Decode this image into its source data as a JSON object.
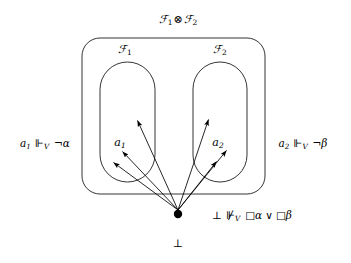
{
  "figure": {
    "type": "logic-frame-diagram",
    "background_color": "#ffffff",
    "stroke_color": "#000000"
  },
  "labels": {
    "tensor_title": "ℱ₁ ⊗ ℱ₂",
    "tensor_title_parts": {
      "left": "ℱ",
      "left_sub": "1",
      "operator": "⊗",
      "right": "ℱ",
      "right_sub": "2"
    },
    "frame_left": "ℱ₁",
    "frame_left_base": "ℱ",
    "frame_left_sub": "1",
    "frame_right": "ℱ₂",
    "frame_right_base": "ℱ",
    "frame_right_sub": "2",
    "node_left": "a₁",
    "node_left_base": "a",
    "node_left_sub": "1",
    "node_right": "a₂",
    "node_right_base": "a",
    "node_right_sub": "2",
    "bottom_node": "⊥"
  },
  "annotations": {
    "left_forcing": {
      "subject": "a",
      "subject_sub": "1",
      "relation": "⊩",
      "relation_sub": "V",
      "formula_neg": "¬",
      "formula_var": "α",
      "full_text": "a₁ ⊩_V ¬α"
    },
    "right_forcing": {
      "subject": "a",
      "subject_sub": "2",
      "relation": "⊩",
      "relation_sub": "V",
      "formula_neg": "¬",
      "formula_var": "β",
      "full_text": "a₂ ⊩_V ¬β"
    },
    "bottom_forcing": {
      "subject": "⊥",
      "relation": "⊮",
      "relation_sub": "V",
      "box_left": "□",
      "var_left": "α",
      "disjunction": "∨",
      "box_right": "□",
      "var_right": "β",
      "full_text": "⊥ ⊮_V □α ∨ □β"
    }
  },
  "shapes": {
    "outer_box": {
      "x": 82,
      "y": 38,
      "width": 183,
      "height": 156,
      "radius": 18
    },
    "capsule_left": {
      "x": 100,
      "y": 62,
      "width": 55,
      "height": 120,
      "radius": 27
    },
    "capsule_right": {
      "x": 193,
      "y": 62,
      "width": 54,
      "height": 120,
      "radius": 27
    },
    "root_dot": {
      "cx": 178,
      "cy": 214,
      "r": 4.2
    }
  },
  "arrows": {
    "count": 6,
    "origin": {
      "x": 178,
      "y": 210
    },
    "targets": [
      {
        "x": 113,
        "y": 162,
        "name": "arrow-to-left-lower"
      },
      {
        "x": 122,
        "y": 151,
        "name": "arrow-to-left-mid"
      },
      {
        "x": 137,
        "y": 120,
        "name": "arrow-to-left-upper"
      },
      {
        "x": 216,
        "y": 161,
        "name": "arrow-to-right-lower"
      },
      {
        "x": 226,
        "y": 150,
        "name": "arrow-to-right-mid"
      },
      {
        "x": 208,
        "y": 119,
        "name": "arrow-to-right-upper"
      }
    ]
  }
}
